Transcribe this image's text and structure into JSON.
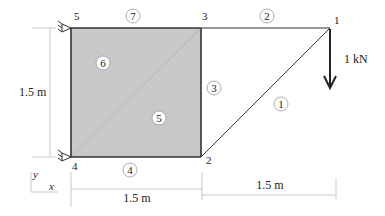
{
  "diagram": {
    "type": "structural-model",
    "nodes": [
      {
        "id": "1",
        "label": "1",
        "x": 330,
        "y": 28
      },
      {
        "id": "2",
        "label": "2",
        "x": 201,
        "y": 157
      },
      {
        "id": "3",
        "label": "3",
        "x": 201,
        "y": 28
      },
      {
        "id": "4",
        "label": "4",
        "x": 71,
        "y": 157
      },
      {
        "id": "5",
        "label": "5",
        "x": 71,
        "y": 28
      }
    ],
    "elements": [
      {
        "id": "1",
        "label": "1",
        "type": "bar",
        "from": "2",
        "to": "1"
      },
      {
        "id": "2",
        "label": "2",
        "type": "bar",
        "from": "3",
        "to": "1"
      },
      {
        "id": "3",
        "label": "3",
        "type": "bar",
        "from": "2",
        "to": "3"
      },
      {
        "id": "4",
        "label": "4",
        "type": "bar",
        "from": "4",
        "to": "2"
      },
      {
        "id": "5",
        "label": "5",
        "type": "triangle",
        "nodes": [
          "4",
          "2",
          "3"
        ]
      },
      {
        "id": "6",
        "label": "6",
        "type": "triangle",
        "nodes": [
          "4",
          "3",
          "5"
        ]
      },
      {
        "id": "7",
        "label": "7",
        "type": "bar",
        "from": "5",
        "to": "3"
      }
    ],
    "supports": [
      {
        "node": "5",
        "type": "pin"
      },
      {
        "node": "4",
        "type": "pin"
      }
    ],
    "load": {
      "node": "1",
      "direction": "down",
      "label": "1 kN"
    },
    "dimensions": {
      "vertical": "1.5 m",
      "horizontal_left": "1.5 m",
      "horizontal_right": "1.5 m"
    },
    "axes": {
      "x": "x",
      "y": "y"
    },
    "colors": {
      "panel_fill": "#c8c8c8",
      "line": "#333333",
      "dimension_line": "#bbbbbb"
    }
  }
}
